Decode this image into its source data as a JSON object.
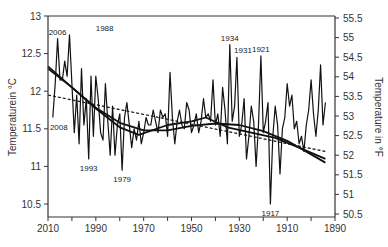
{
  "chart_data": {
    "type": "line",
    "title": "",
    "xlabel": "",
    "ylabel": "Temperaturein °C",
    "ylabel_right": "Temperature in °F",
    "xlim": [
      2010,
      1890
    ],
    "ylim": [
      10.35,
      13
    ],
    "ylim_right": [
      50.5,
      55.5
    ],
    "x_reversed": true,
    "grid": false,
    "legend": null,
    "x_ticks": [
      2010,
      1990,
      1970,
      1950,
      1930,
      1910,
      1890
    ],
    "x_minor_ticks_every": 10,
    "y_ticks": [
      13,
      12.5,
      12,
      11.5,
      11,
      10.5
    ],
    "y_right_ticks": [
      55.5,
      55,
      54.5,
      54,
      53.5,
      53,
      52.5,
      52,
      51.5,
      51,
      50.5
    ],
    "series": [
      {
        "name": "Annual mean temperature",
        "style": "solid-thin",
        "x": [
          2008,
          2007,
          2006,
          2005,
          2004,
          2003,
          2002,
          2001,
          2000,
          1999,
          1998,
          1997,
          1996,
          1995,
          1994,
          1993,
          1992,
          1991,
          1990,
          1989,
          1988,
          1987,
          1986,
          1985,
          1984,
          1983,
          1982,
          1981,
          1980,
          1979,
          1978,
          1977,
          1976,
          1975,
          1974,
          1973,
          1972,
          1971,
          1970,
          1969,
          1968,
          1967,
          1966,
          1965,
          1964,
          1963,
          1962,
          1961,
          1960,
          1959,
          1958,
          1957,
          1956,
          1955,
          1954,
          1953,
          1952,
          1951,
          1950,
          1949,
          1948,
          1947,
          1946,
          1945,
          1944,
          1943,
          1942,
          1941,
          1940,
          1939,
          1938,
          1937,
          1936,
          1935,
          1934,
          1933,
          1932,
          1931,
          1930,
          1929,
          1928,
          1927,
          1926,
          1925,
          1924,
          1923,
          1922,
          1921,
          1920,
          1919,
          1918,
          1917,
          1916,
          1915,
          1914,
          1913,
          1912,
          1911,
          1910,
          1909,
          1908,
          1907,
          1906,
          1905,
          1904,
          1903,
          1902,
          1901,
          1900,
          1899,
          1898,
          1897,
          1896,
          1895,
          1894
        ],
        "values": [
          11.65,
          12.1,
          12.7,
          12.15,
          12.15,
          12.4,
          12.2,
          12.75,
          12.1,
          11.45,
          11.95,
          11.3,
          12.3,
          11.55,
          11.9,
          11.1,
          12.2,
          11.4,
          12.2,
          11.9,
          11.45,
          11.35,
          12.1,
          11.6,
          11.15,
          11.8,
          11.15,
          11.55,
          11.7,
          10.95,
          11.65,
          11.85,
          11.55,
          11.25,
          11.5,
          11.35,
          11.6,
          11.3,
          11.45,
          11.65,
          11.55,
          11.55,
          11.75,
          11.6,
          11.45,
          11.75,
          11.65,
          11.7,
          11.4,
          12.25,
          11.65,
          11.3,
          11.6,
          11.75,
          11.55,
          11.5,
          11.85,
          11.75,
          11.45,
          11.55,
          11.7,
          11.45,
          11.6,
          11.9,
          11.65,
          11.7,
          11.6,
          12.15,
          11.55,
          11.7,
          11.4,
          12.05,
          11.75,
          11.3,
          12.62,
          11.6,
          11.8,
          12.45,
          11.4,
          11.55,
          11.9,
          11.1,
          11.4,
          11.8,
          11.6,
          11.0,
          11.55,
          12.47,
          11.45,
          11.6,
          11.85,
          10.5,
          11.4,
          11.8,
          11.55,
          10.9,
          11.5,
          11.65,
          12.1,
          11.8,
          11.95,
          11.5,
          11.6,
          11.3,
          11.4,
          11.2,
          11.55,
          11.75,
          12.15,
          11.7,
          11.4,
          11.75,
          12.35,
          11.55,
          11.85
        ],
        "annotations": [
          {
            "year": 2006,
            "label": "2006",
            "value": 12.7
          },
          {
            "year": 1988,
            "label": "1988",
            "value": 12.75
          },
          {
            "year": 2008,
            "label": "2008",
            "value": 11.65
          },
          {
            "year": 1993,
            "label": "1993",
            "value": 11.1
          },
          {
            "year": 1979,
            "label": "1979",
            "value": 10.95
          },
          {
            "year": 1934,
            "label": "1934",
            "value": 12.62
          },
          {
            "year": 1931,
            "label": "1931",
            "value": 12.45
          },
          {
            "year": 1921,
            "label": "1921",
            "value": 12.47
          },
          {
            "year": 1917,
            "label": "1917",
            "value": 10.5
          }
        ]
      },
      {
        "name": "Linear trend",
        "style": "dashed",
        "x": [
          2010,
          1894
        ],
        "values": [
          11.95,
          11.2
        ]
      },
      {
        "name": "Polynomial trend",
        "style": "solid-thick",
        "x": [
          2010,
          2000,
          1990,
          1980,
          1970,
          1960,
          1950,
          1940,
          1930,
          1920,
          1910,
          1900,
          1894
        ],
        "values": [
          12.33,
          12.05,
          11.78,
          11.58,
          11.48,
          11.48,
          11.54,
          11.57,
          11.55,
          11.47,
          11.34,
          11.16,
          11.05
        ]
      },
      {
        "name": "Smoothed trend",
        "style": "solid-thick",
        "x": [
          2010,
          2000,
          1990,
          1980,
          1972,
          1960,
          1950,
          1944,
          1935,
          1925,
          1915,
          1905,
          1894
        ],
        "values": [
          12.3,
          12.05,
          11.77,
          11.52,
          11.42,
          11.55,
          11.6,
          11.65,
          11.52,
          11.45,
          11.38,
          11.25,
          11.1
        ]
      }
    ]
  }
}
